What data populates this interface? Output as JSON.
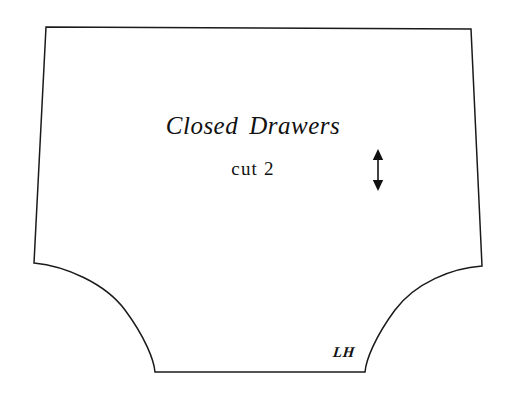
{
  "sheet": {
    "background_color": "#ffffff",
    "width": 506,
    "height": 400
  },
  "pattern": {
    "line_color": "#1a1a1a",
    "fill_color": "#ffffff",
    "outline_path": "M 46 27 L 471 29 L 482 266 C 452 268 415 283 395 310 C 375 337 366 360 365 372 L 155 372 C 154 360 145 337 125 310 C 105 283 65 266 34 263 Z",
    "shape_description": "drawers pattern piece"
  },
  "labels": {
    "title_part1": "Closed",
    "title_part2": "Drawers",
    "cut_count": "cut 2",
    "side_mark": "LH"
  },
  "grainline": {
    "icon": "double-headed-vertical-arrow",
    "color": "#111111"
  }
}
